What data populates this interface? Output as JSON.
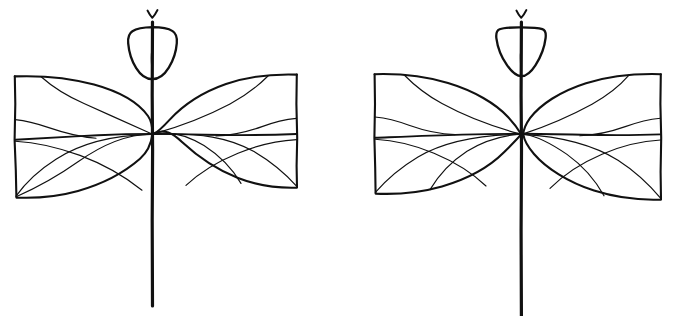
{
  "figure": {
    "kind": "botanical-line-drawing",
    "background_color": "#ffffff",
    "ink_color": "#111111",
    "width": 676,
    "height": 316,
    "specimen_count": 2,
    "caption": ""
  },
  "specimens": [
    {
      "id": "specimen-left",
      "label": "",
      "stem": {
        "x": 152,
        "top_y": 22,
        "bottom_y": 306,
        "stroke_width": 3.2
      },
      "bud": {
        "shape_name": "rounded-cordate-bud",
        "top_y": 27,
        "bottom_y": 78,
        "left_x": 128,
        "right_x": 177,
        "tip_mark": "y-shaped-tip",
        "has_center_vein": true
      },
      "leaves": [
        {
          "side": "left",
          "shape_name": "truncate-based-leaf",
          "outer_edge": "straight-vertical",
          "tip_direction": "toward-stem",
          "top_y": 76,
          "bottom_y": 198,
          "outer_x": 14,
          "inner_x": 150,
          "vein_count": 5
        },
        {
          "side": "right",
          "shape_name": "truncate-based-leaf",
          "outer_edge": "straight-vertical",
          "tip_direction": "toward-stem",
          "top_y": 74,
          "bottom_y": 188,
          "outer_x": 297,
          "inner_x": 154,
          "vein_count": 5
        }
      ]
    },
    {
      "id": "specimen-right",
      "label": "",
      "stem": {
        "x": 521,
        "top_y": 22,
        "bottom_y": 316,
        "stroke_width": 3.2
      },
      "bud": {
        "shape_name": "shield-obtriangular-bud",
        "top_y": 27,
        "bottom_y": 76,
        "left_x": 496,
        "right_x": 543,
        "tip_mark": "y-shaped-tip",
        "has_center_vein": true
      },
      "leaves": [
        {
          "side": "left",
          "shape_name": "broad-obovate-leaf",
          "outer_edge": "straight-vertical",
          "tip_direction": "toward-stem",
          "top_y": 74,
          "bottom_y": 194,
          "outer_x": 374,
          "inner_x": 518,
          "vein_count": 5
        },
        {
          "side": "right",
          "shape_name": "broad-obovate-leaf",
          "outer_edge": "straight-vertical",
          "tip_direction": "toward-stem",
          "top_y": 74,
          "bottom_y": 200,
          "outer_x": 661,
          "inner_x": 525,
          "vein_count": 5
        }
      ]
    }
  ],
  "midrib": {
    "left_specimen_y": 134,
    "right_specimen_y": 134
  }
}
